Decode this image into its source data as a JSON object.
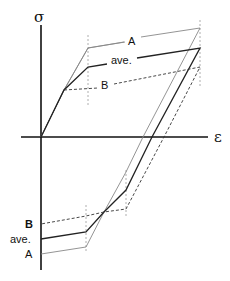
{
  "diagram": {
    "axes": {
      "y_label": "σ",
      "x_label": "ε"
    },
    "curves_top_labels": {
      "A": "A",
      "ave": "ave.",
      "B": "B"
    },
    "curves_bottom_labels": {
      "B": "B",
      "ave": "ave.",
      "A": "A"
    },
    "colors": {
      "axis": "#111111",
      "A": "#888888",
      "ave": "#222222",
      "B": "#333333",
      "guide": "#999999"
    }
  }
}
